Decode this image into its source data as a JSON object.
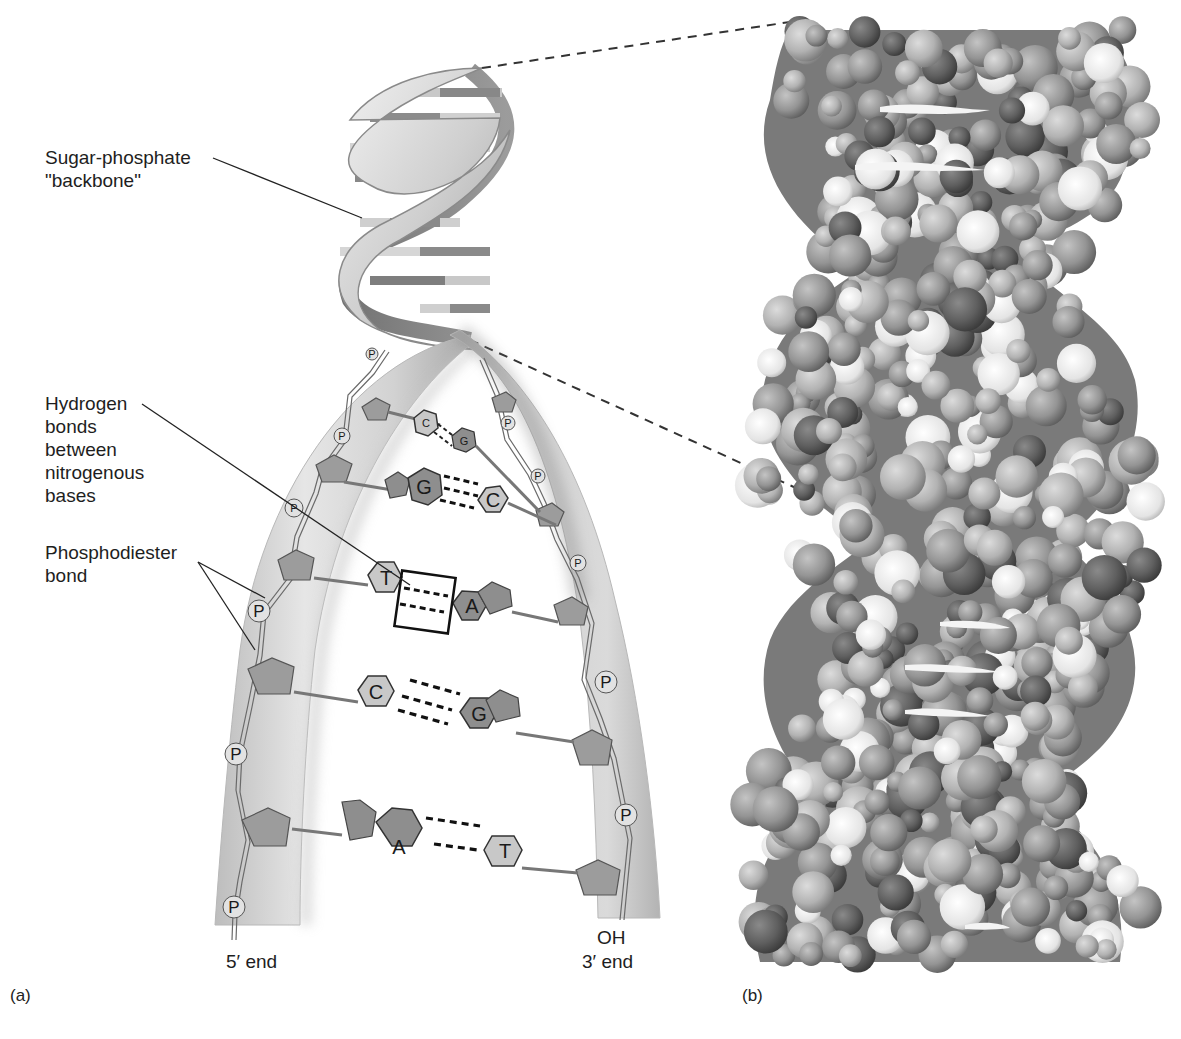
{
  "figure": {
    "panel_a": {
      "id_label": "(a)",
      "labels": {
        "backbone_line1": "Sugar-phosphate",
        "backbone_line2": "\"backbone\"",
        "hbond_line1": "Hydrogen",
        "hbond_line2": "bonds",
        "hbond_line3": "between",
        "hbond_line4": "nitrogenous",
        "hbond_line5": "bases",
        "phosphodiester_line1": "Phosphodiester",
        "phosphodiester_line2": "bond",
        "five_prime": "5′  end",
        "three_prime_oh": "OH",
        "three_prime": "3′  end"
      },
      "phosphate_symbol": "P",
      "base_pairs": [
        {
          "left": "C",
          "right": "G"
        },
        {
          "left": "G",
          "right": "C"
        },
        {
          "left": "T",
          "right": "A",
          "highlighted": true
        },
        {
          "left": "C",
          "right": "G"
        },
        {
          "left": "A",
          "right": "T"
        }
      ]
    },
    "panel_b": {
      "id_label": "(b)",
      "description": "space-filling model"
    },
    "colors": {
      "ribbon_light": "#d9d9d9",
      "ribbon_shadow": "#9a9a9a",
      "purine_fill": "#8e8e8e",
      "pyrimidine_fill": "#c8c8c8",
      "sugar_fill": "#9c9c9c",
      "phosphate_fill": "#dedede",
      "atom_dark": "#5e5e5e",
      "atom_mid": "#8a8a8a",
      "atom_light": "#b5b5b5",
      "atom_white": "#ececec",
      "ink": "#1e1e1e"
    }
  }
}
